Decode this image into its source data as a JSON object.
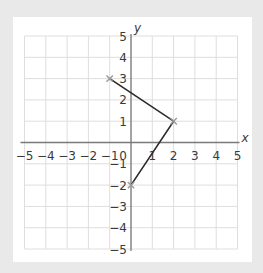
{
  "chart_data": {
    "type": "line",
    "title": "",
    "xlabel": "x",
    "ylabel": "y",
    "xlim": [
      -5,
      5
    ],
    "ylim": [
      -5,
      5
    ],
    "grid": true,
    "x_ticks": [
      -5,
      -4,
      -3,
      -2,
      -1,
      0,
      1,
      2,
      3,
      4,
      5
    ],
    "y_ticks": [
      -5,
      -4,
      -3,
      -2,
      -1,
      1,
      2,
      3,
      4,
      5
    ],
    "x_tick_labels": [
      "−5",
      "−4",
      "−3",
      "−2",
      "−1",
      "0",
      "1",
      "2",
      "3",
      "4",
      "5"
    ],
    "y_tick_labels": [
      "−5",
      "−4",
      "−3",
      "−2",
      "−1",
      "1",
      "2",
      "3",
      "4",
      "5"
    ],
    "series": [
      {
        "name": "polyline",
        "points": [
          {
            "x": -1,
            "y": 3
          },
          {
            "x": 2,
            "y": 1
          },
          {
            "x": 0,
            "y": -2
          }
        ],
        "marker": "x"
      }
    ],
    "colors": {
      "background": "#e9e9e9",
      "panel": "#ffffff",
      "grid": "#dedede",
      "axis": "#7a7a7a",
      "line": "#2a2a2a",
      "marker": "#9a9a9a",
      "text": "#3a3a3a"
    }
  }
}
